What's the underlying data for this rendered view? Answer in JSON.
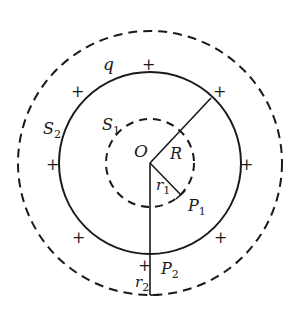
{
  "diagram": {
    "colors": {
      "stroke": "#1a1a1a",
      "background": "#ffffff"
    },
    "center_label": "O",
    "charge_label": "q",
    "sphere_radius_label": "R",
    "gaussian_surfaces": [
      {
        "label_main": "S",
        "label_sub": "1",
        "style": "dashed",
        "position": "inside"
      },
      {
        "label_main": "S",
        "label_sub": "2",
        "style": "dashed",
        "position": "outside"
      }
    ],
    "radii": [
      {
        "label_main": "r",
        "label_sub": "1"
      },
      {
        "label_main": "r",
        "label_sub": "2"
      }
    ],
    "points": [
      {
        "label_main": "P",
        "label_sub": "1"
      },
      {
        "label_main": "P",
        "label_sub": "2"
      }
    ],
    "plus_sign": "+",
    "plus_count": 9
  }
}
